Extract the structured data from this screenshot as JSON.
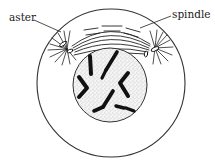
{
  "diagram": {
    "labels": {
      "aster": "aster",
      "spindle": "spindle"
    },
    "structures": [
      {
        "id": "cell-membrane",
        "shape": "circle",
        "center": [
          111,
          83
        ],
        "radius": 74
      },
      {
        "id": "nucleus",
        "shape": "circle",
        "center": [
          110,
          85
        ],
        "radius": 37,
        "fill": "stippled"
      },
      {
        "id": "aster-left",
        "center": [
          67,
          49
        ]
      },
      {
        "id": "aster-right",
        "center": [
          155,
          48
        ]
      },
      {
        "id": "spindle",
        "between": [
          "aster-left",
          "aster-right"
        ]
      },
      {
        "id": "chromosomes",
        "count": 6
      }
    ],
    "colors": {
      "ink": "#1a1a1a",
      "background": "#ffffff",
      "nucleus_stipple": "#9a9a9a"
    }
  }
}
